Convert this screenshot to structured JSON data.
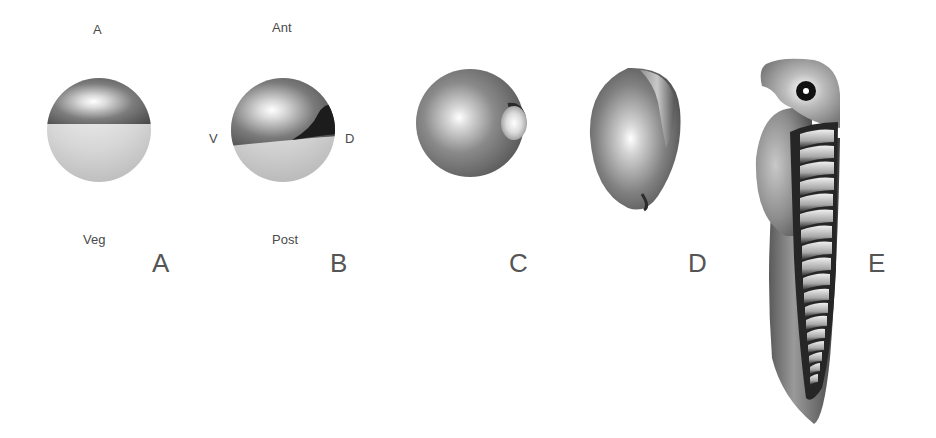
{
  "figure": {
    "panels": [
      {
        "id": "A",
        "letter": "A",
        "description": "Spherical egg with dark animal hemisphere and light vegetal hemisphere",
        "labels": {
          "top": "A",
          "bottom": "Veg"
        }
      },
      {
        "id": "B",
        "letter": "B",
        "description": "Spherical embryo with dorsal dark crescent; axes labeled",
        "labels": {
          "top": "Ant",
          "left": "V",
          "right": "D",
          "bottom": "Post"
        }
      },
      {
        "id": "C",
        "letter": "C",
        "description": "Sphere with small lateral bulge (blastopore lip region)"
      },
      {
        "id": "D",
        "letter": "D",
        "description": "Elongating ovoid embryo with dorsal ridge"
      },
      {
        "id": "E",
        "letter": "E",
        "description": "Tailbud/tadpole-stage embryo with eye, head, yolk belly and segmented somites",
        "somite_count": 18
      }
    ],
    "colors": {
      "background": "#ffffff",
      "dark_shade": "#3a3a3a",
      "mid_shade": "#7a7a7a",
      "light_shade": "#d0d0d0",
      "text": "#4a4a4a"
    }
  }
}
